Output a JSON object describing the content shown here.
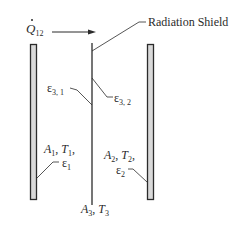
{
  "diagram": {
    "title_label": "Radiation Shield",
    "heat_flow": {
      "symbol": "Q",
      "subscript": "12",
      "has_dot": true,
      "arrow_direction": "right"
    },
    "surfaces": [
      {
        "id": "plate-1",
        "area": "A",
        "area_sub": "1",
        "temp": "T",
        "temp_sub": "1",
        "emissivity": "ε",
        "emissivity_sub": "1"
      },
      {
        "id": "plate-2",
        "area": "A",
        "area_sub": "2",
        "temp": "T",
        "temp_sub": "2",
        "emissivity": "ε",
        "emissivity_sub": "2"
      },
      {
        "id": "shield-3",
        "area": "A",
        "area_sub": "3",
        "temp": "T",
        "temp_sub": "3"
      }
    ],
    "shield_emissivities": [
      {
        "symbol": "ε",
        "sub": "3, 1"
      },
      {
        "symbol": "ε",
        "sub": "3, 2"
      }
    ],
    "separator": ",",
    "colors": {
      "line": "#2b2b2b",
      "plate_fill": "#d9d9d9",
      "background": "#ffffff"
    }
  }
}
